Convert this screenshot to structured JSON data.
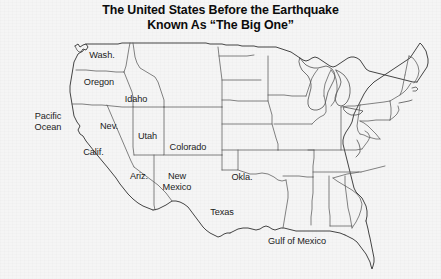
{
  "title": {
    "line1": "The United States Before the Earthquake",
    "line2": "Known As “The Big One”"
  },
  "colors": {
    "background": "#f4f4f4",
    "map_outline": "#3a3a3a",
    "state_border": "#555555",
    "label_text": "#1b1b1b",
    "title_text": "#0b0b0b"
  },
  "map": {
    "type": "political-map",
    "region": "Continental United States",
    "labels": [
      {
        "name": "washington",
        "text": "Wash.",
        "x": 85,
        "y": 50,
        "w": 34,
        "lines": 1
      },
      {
        "name": "oregon",
        "text": "Oregon",
        "x": 76,
        "y": 77,
        "w": 46,
        "lines": 1
      },
      {
        "name": "idaho",
        "text": "Idaho",
        "x": 119,
        "y": 94,
        "w": 34,
        "lines": 1
      },
      {
        "name": "nevada",
        "text": "Nev.",
        "x": 95,
        "y": 121,
        "w": 28,
        "lines": 1
      },
      {
        "name": "utah",
        "text": "Utah",
        "x": 133,
        "y": 131,
        "w": 29,
        "lines": 1
      },
      {
        "name": "california",
        "text": "Calif.",
        "x": 78,
        "y": 147,
        "w": 31,
        "lines": 1
      },
      {
        "name": "colorado",
        "text": "Colorado",
        "x": 160,
        "y": 142,
        "w": 56,
        "lines": 1
      },
      {
        "name": "arizona",
        "text": "Ariz.",
        "x": 125,
        "y": 171,
        "w": 28,
        "lines": 1
      },
      {
        "name": "new-mexico",
        "text": "New\nMexico",
        "x": 157,
        "y": 171,
        "w": 40,
        "lines": 2
      },
      {
        "name": "oklahoma",
        "text": "Okla.",
        "x": 227,
        "y": 172,
        "w": 30,
        "lines": 1
      },
      {
        "name": "texas",
        "text": "Texas",
        "x": 205,
        "y": 207,
        "w": 34,
        "lines": 1
      }
    ],
    "water_labels": [
      {
        "name": "pacific-ocean",
        "text": "Pacific\nOcean",
        "x": 26,
        "y": 111,
        "w": 44,
        "lines": 2
      },
      {
        "name": "gulf-of-mexico",
        "text": "Gulf of Mexico",
        "x": 260,
        "y": 236,
        "w": 74,
        "lines": 1
      }
    ]
  }
}
